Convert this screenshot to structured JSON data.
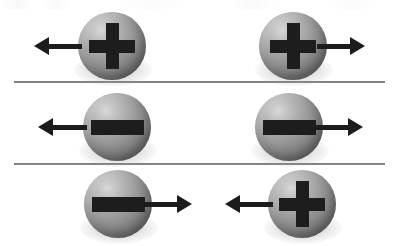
{
  "figure": {
    "width": 399,
    "height": 246,
    "background_color": "#ffffff",
    "divider_color": "#7a7a7a",
    "sphere_base_color": "#8e8e8e",
    "sphere_highlight_color": "#d8d8d8",
    "sphere_shade_color": "#5a5a5a",
    "sign_color": "#1d1d1d",
    "arrow_color": "#1c1c1c"
  },
  "dividers": [
    {
      "name": "divider-1",
      "x": 14,
      "y": 81,
      "width": 371
    },
    {
      "name": "divider-2",
      "x": 14,
      "y": 163,
      "width": 371
    }
  ],
  "rows": [
    {
      "id": "row-1",
      "label": "Row 1: two positive charges moving apart",
      "particles": [
        {
          "id": "row1-left",
          "charge": "+",
          "charge_name": "positive",
          "arrow_direction": "left",
          "sphere": {
            "x": 78,
            "y": 12,
            "size": 68
          },
          "arrow": {
            "x": 34,
            "y": 46,
            "length": 48
          }
        },
        {
          "id": "row1-right",
          "charge": "+",
          "charge_name": "positive",
          "arrow_direction": "right",
          "sphere": {
            "x": 259,
            "y": 12,
            "size": 68
          },
          "arrow": {
            "x": 317,
            "y": 46,
            "length": 48
          }
        }
      ]
    },
    {
      "id": "row-2",
      "label": "Row 2: two negative charges moving apart",
      "particles": [
        {
          "id": "row2-left",
          "charge": "-",
          "charge_name": "negative",
          "arrow_direction": "left",
          "sphere": {
            "x": 83,
            "y": 93,
            "size": 68
          },
          "arrow": {
            "x": 38,
            "y": 127,
            "length": 49
          }
        },
        {
          "id": "row2-right",
          "charge": "-",
          "charge_name": "negative",
          "arrow_direction": "right",
          "sphere": {
            "x": 255,
            "y": 93,
            "size": 68
          },
          "arrow": {
            "x": 314,
            "y": 127,
            "length": 49
          }
        }
      ]
    },
    {
      "id": "row-3",
      "label": "Row 3: a negative and a positive charge moving toward each other",
      "particles": [
        {
          "id": "row3-left",
          "charge": "-",
          "charge_name": "negative",
          "arrow_direction": "right",
          "sphere": {
            "x": 84,
            "y": 170,
            "size": 68
          },
          "arrow": {
            "x": 144,
            "y": 204,
            "length": 48
          }
        },
        {
          "id": "row3-right",
          "charge": "+",
          "charge_name": "positive",
          "arrow_direction": "left",
          "sphere": {
            "x": 268,
            "y": 170,
            "size": 68
          },
          "arrow": {
            "x": 225,
            "y": 204,
            "length": 48
          }
        }
      ]
    }
  ],
  "glyphs": {
    "plus": "+",
    "minus": "−"
  }
}
